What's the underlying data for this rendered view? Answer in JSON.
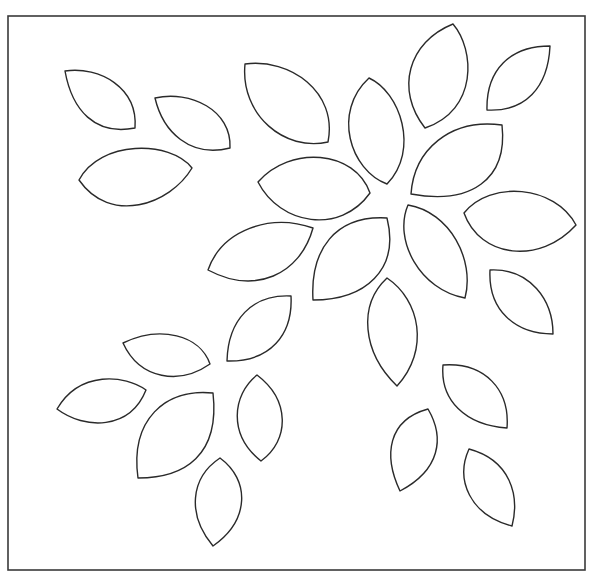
{
  "canvas": {
    "width": 591,
    "height": 576,
    "background": "#ffffff"
  },
  "frame": {
    "x": 8,
    "y": 16,
    "width": 577,
    "height": 554,
    "stroke": "#3a3a3a"
  },
  "style": {
    "leaf_stroke": "#2a2a2a",
    "leaf_fill": "#ffffff"
  },
  "leaves": [
    {
      "name": "leaf-01",
      "d": "M65,71 C100,66 138,88 135,128 C95,136 72,110 65,71 Z"
    },
    {
      "name": "leaf-02",
      "d": "M155,98 C190,90 232,110 230,148 C190,158 163,132 155,98 Z"
    },
    {
      "name": "leaf-03",
      "d": "M79,180 C100,140 170,140 192,168 C170,205 110,225 79,180 Z"
    },
    {
      "name": "leaf-04",
      "d": "M245,64 C290,58 338,92 328,142 C285,152 240,115 245,64 Z"
    },
    {
      "name": "leaf-05",
      "d": "M369,78 C400,92 420,150 387,184 C350,170 332,112 369,78 Z"
    },
    {
      "name": "leaf-06",
      "d": "M453,24 C475,50 478,110 425,128 C395,90 408,42 453,24 Z"
    },
    {
      "name": "leaf-07",
      "d": "M550,46 C548,88 525,112 487,110 C486,70 510,46 550,46 Z"
    },
    {
      "name": "leaf-08",
      "d": "M502,125 C508,180 470,205 411,194 C414,150 450,118 502,125 Z"
    },
    {
      "name": "leaf-09",
      "d": "M258,182 C290,145 355,150 370,193 C340,235 280,225 258,182 Z"
    },
    {
      "name": "leaf-10",
      "d": "M464,213 C490,180 555,185 576,225 C540,265 480,258 464,213 Z"
    },
    {
      "name": "leaf-11",
      "d": "M313,228 C300,275 255,295 208,270 C222,230 270,213 313,228 Z"
    },
    {
      "name": "leaf-12",
      "d": "M387,218 C400,270 365,300 313,300 C310,250 335,215 387,218 Z"
    },
    {
      "name": "leaf-13",
      "d": "M408,205 C450,212 475,260 465,298 C420,290 393,240 408,205 Z"
    },
    {
      "name": "leaf-14",
      "d": "M490,270 C530,268 553,300 553,334 C515,334 488,310 490,270 Z"
    },
    {
      "name": "leaf-15",
      "d": "M387,278 C420,300 430,350 397,386 C362,352 358,305 387,278 Z"
    },
    {
      "name": "leaf-16",
      "d": "M291,296 C293,335 270,362 227,361 C228,320 252,294 291,296 Z"
    },
    {
      "name": "leaf-17",
      "d": "M123,343 C160,325 200,335 210,364 C180,385 140,380 123,343 Z"
    },
    {
      "name": "leaf-18",
      "d": "M57,409 C80,370 125,375 146,390 C130,430 85,430 57,409 Z"
    },
    {
      "name": "leaf-19",
      "d": "M213,393 C220,455 185,478 138,478 C130,420 165,388 213,393 Z"
    },
    {
      "name": "leaf-20",
      "d": "M257,375 C290,400 290,440 261,461 C228,435 232,395 257,375 Z"
    },
    {
      "name": "leaf-21",
      "d": "M220,458 C250,480 250,520 213,546 C187,515 190,478 220,458 Z"
    },
    {
      "name": "leaf-22",
      "d": "M443,365 C485,362 510,390 507,428 C465,425 440,400 443,365 Z"
    },
    {
      "name": "leaf-23",
      "d": "M428,409 C445,438 440,470 400,491 C383,455 388,420 428,409 Z"
    },
    {
      "name": "leaf-24",
      "d": "M469,449 C510,460 520,495 512,526 C470,515 455,480 469,449 Z"
    }
  ]
}
